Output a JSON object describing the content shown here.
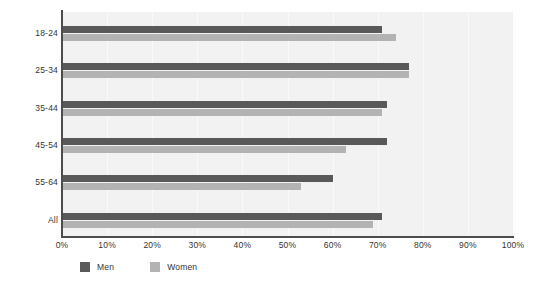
{
  "chart_data": {
    "type": "bar",
    "orientation": "horizontal",
    "title": "",
    "subtitle": "",
    "xlabel": "",
    "ylabel": "",
    "categories": [
      "18-24",
      "25-34",
      "35-44",
      "45-54",
      "55-64",
      "All"
    ],
    "series": [
      {
        "name": "Men",
        "color": "#595959",
        "values": [
          71,
          77,
          72,
          72,
          60,
          71
        ]
      },
      {
        "name": "Women",
        "color": "#b3b3b3",
        "values": [
          74,
          77,
          71,
          63,
          53,
          69
        ]
      }
    ],
    "xlim": [
      0,
      100
    ],
    "xticks": [
      0,
      10,
      20,
      30,
      40,
      50,
      60,
      70,
      80,
      90,
      100
    ],
    "xtick_labels": [
      "0%",
      "10%",
      "20%",
      "30%",
      "40%",
      "50%",
      "60%",
      "70%",
      "80%",
      "90%",
      "100%"
    ],
    "grid": true,
    "grid_axis": "x",
    "legend_position": "bottom-left",
    "legend": [
      {
        "label": "Men",
        "color": "#595959"
      },
      {
        "label": "Women",
        "color": "#b3b3b3"
      }
    ],
    "plot_background": "#f2f2f2",
    "page_background": "#ffffff",
    "axis_color": "#4d4d4d"
  }
}
